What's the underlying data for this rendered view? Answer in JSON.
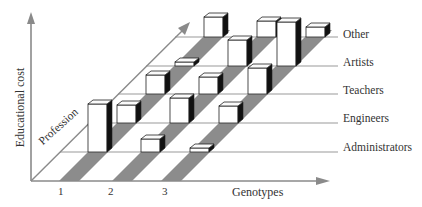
{
  "chart_data": {
    "type": "bar",
    "subtype": "3d-bar-grid",
    "title": "",
    "xlabel": "Genotypes",
    "ylabel": "Educational cost",
    "zlabel": "Profession",
    "categories": [
      "1",
      "2",
      "3"
    ],
    "rows": [
      "Administrators",
      "Engineers",
      "Teachers",
      "Artists",
      "Other"
    ],
    "series": [
      {
        "name": "Administrators",
        "values": [
          48,
          13,
          4
        ]
      },
      {
        "name": "Engineers",
        "values": [
          18,
          25,
          17
        ]
      },
      {
        "name": "Teachers",
        "values": [
          19,
          17,
          26
        ]
      },
      {
        "name": "Artists",
        "values": [
          4,
          26,
          44
        ]
      },
      {
        "name": "Other",
        "values": [
          20,
          16,
          10
        ]
      }
    ],
    "grid": true,
    "legend": "row labels at right",
    "colors": {
      "axis": "#8a8a8a",
      "stripe": "#8c8c8c",
      "bar_face": "#ffffff",
      "bar_side": "#111111",
      "bar_edge": "#222222"
    }
  },
  "labels": {
    "y_axis": "Educational cost",
    "x_axis": "Genotypes",
    "depth_axis": "Profession",
    "x_ticks": [
      "1",
      "2",
      "3"
    ],
    "rows": [
      "Other",
      "Artists",
      "Teachers",
      "Engineers",
      "Administrators"
    ]
  }
}
